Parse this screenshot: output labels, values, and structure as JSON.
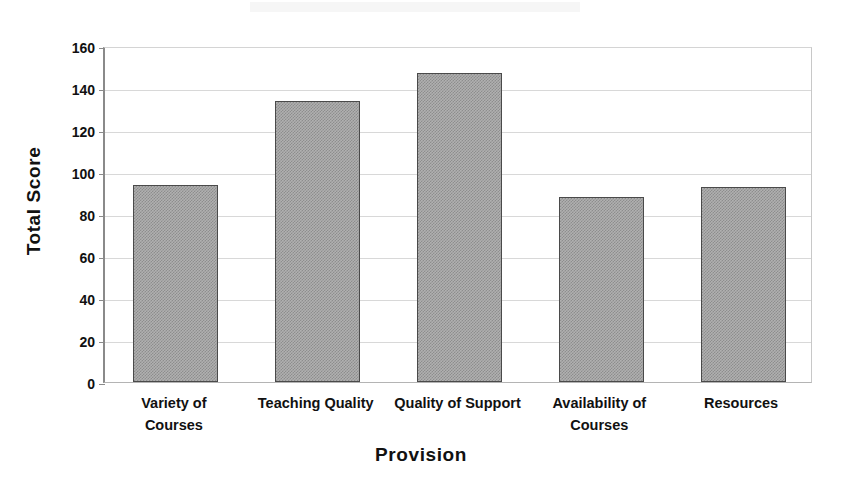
{
  "chart_data": {
    "type": "bar",
    "title": "",
    "xlabel": "Provision",
    "ylabel": "Total Score",
    "categories": [
      "Variety of Courses",
      "Teaching Quality",
      "Quality of Support",
      "Availability of Courses",
      "Resources"
    ],
    "category_lines": [
      [
        "Variety of",
        "Courses"
      ],
      [
        "Teaching Quality",
        ""
      ],
      [
        "Quality of Support",
        ""
      ],
      [
        "Availability of",
        "Courses"
      ],
      [
        "Resources",
        ""
      ]
    ],
    "values": [
      94,
      134,
      147,
      88,
      93
    ],
    "ylim": [
      0,
      160
    ],
    "ytick_step": 20,
    "yticks": [
      0,
      20,
      40,
      60,
      80,
      100,
      120,
      140,
      160
    ],
    "ytick_labels": [
      "0",
      "20",
      "40",
      "60",
      "80",
      "100",
      "120",
      "140",
      "160"
    ],
    "grid": true,
    "legend": "none",
    "bar_fill": "#b0b0b0",
    "bar_border": "#4a4a4a",
    "plot_background": "#ffffff"
  }
}
